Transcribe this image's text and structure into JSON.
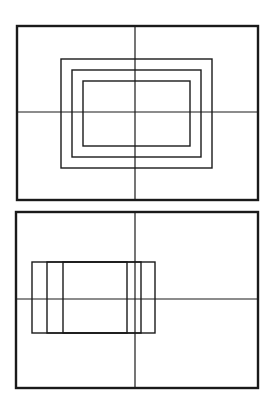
{
  "diagram": {
    "background": "#ffffff",
    "stroke": "#1a1a1a",
    "panels": [
      {
        "name": "top-panel",
        "frame": {
          "x": 17,
          "y": 26,
          "w": 241,
          "h": 174
        },
        "crosshair": {
          "x": 135,
          "y": 112
        },
        "rects": [
          {
            "x": 61,
            "y": 59,
            "w": 151,
            "h": 109
          },
          {
            "x": 72,
            "y": 70,
            "w": 129,
            "h": 87
          },
          {
            "x": 83,
            "y": 81,
            "w": 107,
            "h": 65
          }
        ]
      },
      {
        "name": "bottom-panel",
        "frame": {
          "x": 16,
          "y": 212,
          "w": 242,
          "h": 176
        },
        "crosshair": {
          "x": 135,
          "y": 299
        },
        "rects": [
          {
            "x": 32,
            "y": 262,
            "w": 123,
            "h": 71
          },
          {
            "x": 47,
            "y": 262,
            "w": 94,
            "h": 71
          },
          {
            "x": 63,
            "y": 262,
            "w": 64,
            "h": 71
          }
        ]
      }
    ]
  }
}
